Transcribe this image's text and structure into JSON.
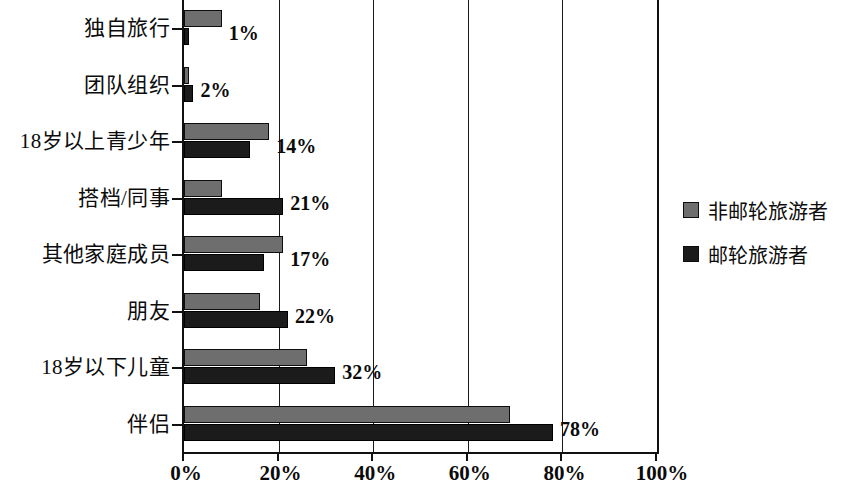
{
  "chart_data": {
    "type": "bar",
    "orientation": "horizontal",
    "title": "",
    "xlabel": "",
    "ylabel": "",
    "xlim": [
      0,
      100
    ],
    "xticks": [
      "0%",
      "20%",
      "40%",
      "60%",
      "80%",
      "100%"
    ],
    "xtick_values": [
      0,
      20,
      40,
      60,
      80,
      100
    ],
    "grid": true,
    "grid_axis": "x",
    "legend_position": "right",
    "categories": [
      "独自旅行",
      "团队组织",
      "18岁以上青少年",
      "搭档/同事",
      "其他家庭成员",
      "朋友",
      "18岁以下儿童",
      "伴侣"
    ],
    "series": [
      {
        "name": "非邮轮旅游者",
        "color": "#6e6e6e",
        "values": [
          8,
          1,
          18,
          8,
          21,
          16,
          26,
          69
        ]
      },
      {
        "name": "邮轮旅游者",
        "color": "#1b1b1b",
        "values": [
          1,
          2,
          14,
          21,
          17,
          22,
          32,
          78
        ]
      }
    ],
    "data_labels": [
      "1%",
      "2%",
      "14%",
      "21%",
      "17%",
      "22%",
      "32%",
      "78%"
    ]
  },
  "legend": {
    "items": [
      {
        "label": "非邮轮旅游者",
        "color": "#6e6e6e"
      },
      {
        "label": "邮轮旅游者",
        "color": "#1b1b1b"
      }
    ]
  }
}
